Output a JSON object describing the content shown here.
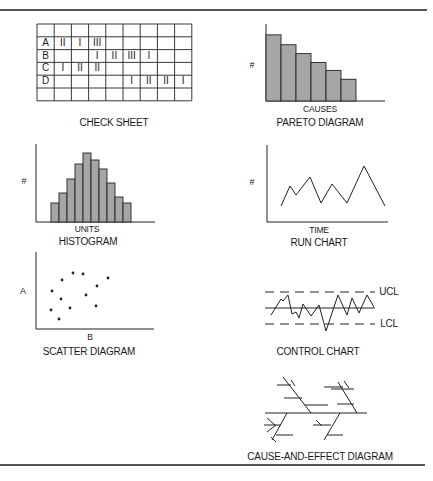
{
  "check_sheet": {
    "title": "CHECK SHEET",
    "columns": 9,
    "rows": [
      {
        "label": "",
        "marks": [
          "",
          "",
          "",
          "",
          "",
          "",
          "",
          ""
        ]
      },
      {
        "label": "A",
        "marks": [
          "II",
          "I",
          "III",
          "",
          "",
          "",
          "",
          ""
        ]
      },
      {
        "label": "B",
        "marks": [
          "",
          "",
          "I",
          "II",
          "III",
          "I",
          "",
          ""
        ]
      },
      {
        "label": "C",
        "marks": [
          "I",
          "II",
          "II",
          "",
          "",
          "",
          "",
          ""
        ]
      },
      {
        "label": "D",
        "marks": [
          "",
          "",
          "",
          "",
          "I",
          "II",
          "II",
          "I"
        ]
      },
      {
        "label": "",
        "marks": [
          "",
          "",
          "",
          "",
          "",
          "",
          "",
          ""
        ]
      }
    ]
  },
  "pareto": {
    "title": "PARETO DIAGRAM",
    "xlabel": "CAUSES",
    "ylabel": "#"
  },
  "histogram": {
    "title": "HISTOGRAM",
    "xlabel": "UNITS",
    "ylabel": "#"
  },
  "run_chart": {
    "title": "RUN CHART",
    "xlabel": "TIME",
    "ylabel": "#"
  },
  "scatter": {
    "title": "SCATTER DIAGRAM",
    "xlabel": "B",
    "ylabel": "A"
  },
  "control_chart": {
    "title": "CONTROL CHART",
    "ucl_label": "UCL",
    "lcl_label": "LCL"
  },
  "cause_effect": {
    "title": "CAUSE-AND-EFFECT DIAGRAM"
  },
  "colors": {
    "bar_fill": "#a6a6a6",
    "stroke": "#222222",
    "rule": "#555555"
  },
  "chart_data": [
    {
      "type": "table",
      "title": "CHECK SHEET",
      "row_labels": [
        "",
        "A",
        "B",
        "C",
        "D",
        ""
      ],
      "cells": [
        [
          "",
          "",
          "",
          "",
          "",
          "",
          "",
          ""
        ],
        [
          "II",
          "I",
          "III",
          "",
          "",
          "",
          "",
          ""
        ],
        [
          "",
          "",
          "I",
          "II",
          "III",
          "I",
          "",
          ""
        ],
        [
          "I",
          "II",
          "II",
          "",
          "",
          "",
          "",
          ""
        ],
        [
          "",
          "",
          "",
          "",
          "I",
          "II",
          "II",
          "I"
        ],
        [
          "",
          "",
          "",
          "",
          "",
          "",
          "",
          ""
        ]
      ]
    },
    {
      "type": "bar",
      "title": "PARETO DIAGRAM",
      "xlabel": "CAUSES",
      "ylabel": "#",
      "categories": [
        "1",
        "2",
        "3",
        "4",
        "5",
        "6"
      ],
      "values": [
        67,
        57,
        48,
        39,
        31,
        22
      ],
      "ylim": [
        0,
        78
      ],
      "grid": false
    },
    {
      "type": "bar",
      "title": "HISTOGRAM",
      "xlabel": "UNITS",
      "ylabel": "#",
      "categories": [
        "1",
        "2",
        "3",
        "4",
        "5",
        "6",
        "7",
        "8",
        "9",
        "10"
      ],
      "values": [
        19,
        29,
        43,
        58,
        69,
        62,
        53,
        39,
        25,
        19
      ],
      "ylim": [
        0,
        78
      ],
      "grid": false
    },
    {
      "type": "line",
      "title": "RUN CHART",
      "xlabel": "TIME",
      "ylabel": "#",
      "x": [
        14,
        23,
        29,
        43,
        54,
        65,
        80,
        97,
        118
      ],
      "values": [
        16,
        36,
        27,
        45,
        19,
        38,
        19,
        56,
        16
      ],
      "ylim": [
        0,
        77
      ],
      "grid": false
    },
    {
      "type": "scatter",
      "title": "SCATTER DIAGRAM",
      "xlabel": "B",
      "ylabel": "A",
      "points": [
        [
          37,
          56
        ],
        [
          47,
          55
        ],
        [
          26,
          49
        ],
        [
          72,
          51
        ],
        [
          61,
          43
        ],
        [
          16,
          38
        ],
        [
          50,
          34
        ],
        [
          25,
          30
        ],
        [
          15,
          19
        ],
        [
          34,
          21
        ],
        [
          60,
          23
        ],
        [
          23,
          10
        ]
      ],
      "grid": false
    },
    {
      "type": "line",
      "title": "CONTROL CHART",
      "series": [
        {
          "name": "process",
          "values": [
            -7,
            9,
            7,
            13,
            -6,
            -4,
            -10,
            4,
            -8,
            3,
            -23,
            13,
            -7,
            10,
            -5,
            13,
            1
          ]
        }
      ],
      "annotations": [
        "UCL",
        "LCL"
      ],
      "ucl": 16,
      "lcl": -16,
      "center": 0
    }
  ]
}
